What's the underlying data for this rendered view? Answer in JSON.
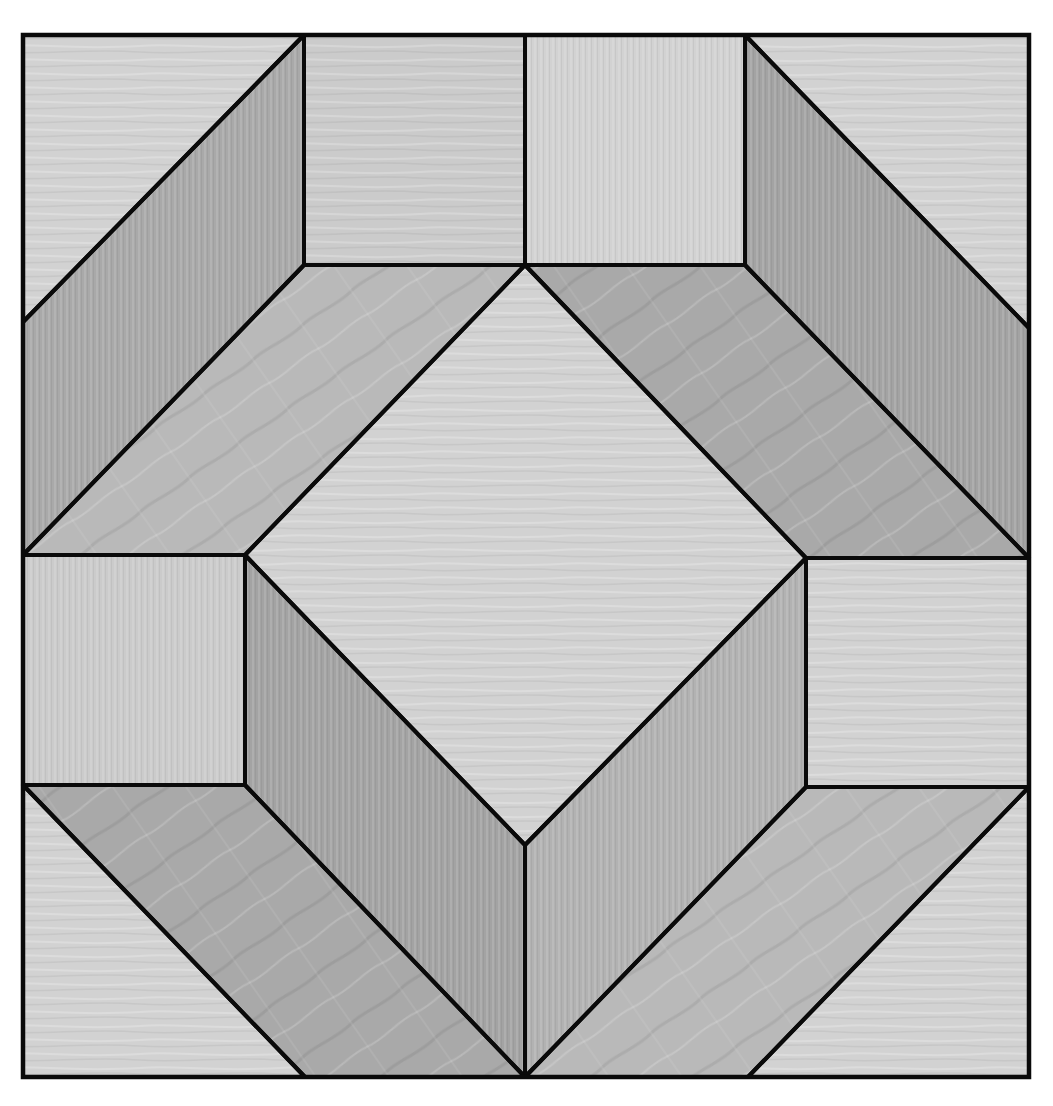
{
  "diagram": {
    "type": "quilt-block",
    "canvas": {
      "width": 1053,
      "height": 1106
    },
    "frame": {
      "x0": 23,
      "y0": 35,
      "x1": 1029,
      "y1": 1077
    },
    "colors": {
      "light": "#d2d2d2",
      "light_alt": "#cbcbcb",
      "medium": "#b9b9b9",
      "medium_alt": "#b2b2b2",
      "dark": "#a9a9a9",
      "dark_alt": "#a3a3a3",
      "outline": "#0a0a0a",
      "background": "#ffffff"
    },
    "pieces": [
      {
        "id": "corner-triangle-top-left",
        "tone": "light",
        "points": "23,35 304,35 23,322"
      },
      {
        "id": "parallelogram-top-left",
        "tone": "dark",
        "points": "304,35 304,265 23,555 23,322"
      },
      {
        "id": "square-top-center-left",
        "tone": "light_alt",
        "points": "304,35 525,35 525,265 304,265"
      },
      {
        "id": "square-top-center-right",
        "tone": "light",
        "points": "525,35 745,35 745,265 525,265"
      },
      {
        "id": "parallelogram-top-right",
        "tone": "dark_alt",
        "points": "745,35 1029,328 1029,558 745,265"
      },
      {
        "id": "corner-triangle-top-right",
        "tone": "light",
        "points": "745,35 1029,35 1029,328"
      },
      {
        "id": "trapezoid-upper-left",
        "tone": "medium",
        "points": "304,265 525,265 245,555 23,555"
      },
      {
        "id": "trapezoid-upper-right",
        "tone": "dark",
        "points": "525,265 745,265 1029,558 806,558"
      },
      {
        "id": "center-diamond",
        "tone": "light",
        "points": "525,265 806,558 525,845 245,555"
      },
      {
        "id": "square-left-middle",
        "tone": "light_alt",
        "points": "23,555 245,555 245,785 23,785"
      },
      {
        "id": "square-right-middle",
        "tone": "light",
        "points": "806,558 1029,558 1029,787 806,787"
      },
      {
        "id": "parallelogram-lower-left",
        "tone": "dark_alt",
        "points": "245,555 525,845 525,1077 245,785"
      },
      {
        "id": "parallelogram-lower-right",
        "tone": "medium_alt",
        "points": "806,558 806,787 525,1077 525,845"
      },
      {
        "id": "trapezoid-lower-left",
        "tone": "dark",
        "points": "23,785 245,785 525,1077 305,1077"
      },
      {
        "id": "trapezoid-lower-right",
        "tone": "medium",
        "points": "806,787 1029,787 748,1077 525,1077"
      },
      {
        "id": "corner-triangle-bottom-left",
        "tone": "light",
        "points": "23,785 305,1077 23,1077"
      },
      {
        "id": "corner-triangle-bottom-right",
        "tone": "light",
        "points": "1029,787 1029,1077 748,1077"
      }
    ]
  }
}
